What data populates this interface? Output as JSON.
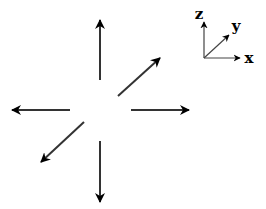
{
  "diagram": {
    "center": [
      100,
      110
    ],
    "arrow_color": "#000000",
    "shaft_color": "#333333",
    "arrows": [
      {
        "direction": "+z (up)",
        "from": [
          100,
          80
        ],
        "to": [
          100,
          20
        ]
      },
      {
        "direction": "-z (down)",
        "from": [
          100,
          141
        ],
        "to": [
          100,
          202
        ]
      },
      {
        "direction": "-x (left)",
        "from": [
          70,
          110
        ],
        "to": [
          12,
          110
        ]
      },
      {
        "direction": "+x (right)",
        "from": [
          131,
          110
        ],
        "to": [
          189,
          110
        ]
      },
      {
        "direction": "+y (up-right)",
        "from": [
          118,
          96
        ],
        "to": [
          160,
          58
        ]
      },
      {
        "direction": "-y (down-left)",
        "from": [
          84,
          122
        ],
        "to": [
          41,
          162
        ]
      }
    ],
    "axes_indicator": {
      "origin": [
        204,
        58
      ],
      "axes": [
        {
          "label": "z",
          "to": [
            204,
            22
          ]
        },
        {
          "label": "y",
          "to": [
            229,
            35
          ]
        },
        {
          "label": "x",
          "to": [
            240,
            58
          ]
        }
      ]
    }
  }
}
